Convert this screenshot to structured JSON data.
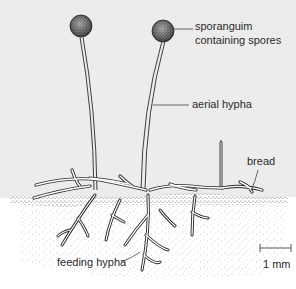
{
  "diagram": {
    "labels": {
      "sporangium_line1": "sporanguim",
      "sporangium_line2": "containing spores",
      "aerial_hypha": "aerial hypha",
      "bread": "bread",
      "feeding_hypha": "feeding hypha",
      "scale": "1 mm"
    },
    "parts": [
      "sporangium",
      "aerial hypha",
      "bread",
      "feeding hypha",
      "scale bar"
    ],
    "colors": {
      "background_upper": "#ececec",
      "background_lower": "#ffffff",
      "ink": "#2b2b2b",
      "sporangium": "#4a4a4a"
    }
  }
}
